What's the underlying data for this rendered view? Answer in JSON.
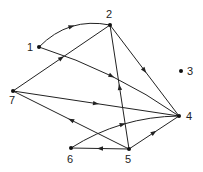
{
  "diagram": {
    "type": "directed-graph",
    "nodes": [
      {
        "id": "1",
        "label": "1",
        "x": 39,
        "y": 47,
        "lx": 27,
        "ly": 51
      },
      {
        "id": "2",
        "label": "2",
        "x": 110,
        "y": 25,
        "lx": 106,
        "ly": 18
      },
      {
        "id": "3",
        "label": "3",
        "x": 181,
        "y": 71,
        "lx": 187,
        "ly": 75
      },
      {
        "id": "4",
        "label": "4",
        "x": 179,
        "y": 116,
        "lx": 186,
        "ly": 120
      },
      {
        "id": "5",
        "label": "5",
        "x": 129,
        "y": 149,
        "lx": 125,
        "ly": 163
      },
      {
        "id": "6",
        "label": "6",
        "x": 71,
        "y": 148,
        "lx": 67,
        "ly": 163
      },
      {
        "id": "7",
        "label": "7",
        "x": 13,
        "y": 91,
        "lx": 9,
        "ly": 104
      }
    ],
    "edges": [
      {
        "from": "1",
        "to": "2",
        "curve": -10
      },
      {
        "from": "7",
        "to": "2",
        "curve": 0
      },
      {
        "from": "1",
        "to": "4",
        "curve": -6
      },
      {
        "from": "2",
        "to": "4",
        "curve": 0
      },
      {
        "from": "5",
        "to": "2",
        "curve": 0
      },
      {
        "from": "7",
        "to": "4",
        "curve": 0
      },
      {
        "from": "5",
        "to": "7",
        "curve": 0
      },
      {
        "from": "6",
        "to": "4",
        "curve": -8
      },
      {
        "from": "5",
        "to": "4",
        "curve": 0
      },
      {
        "from": "5",
        "to": "6",
        "curve": 0
      }
    ]
  }
}
